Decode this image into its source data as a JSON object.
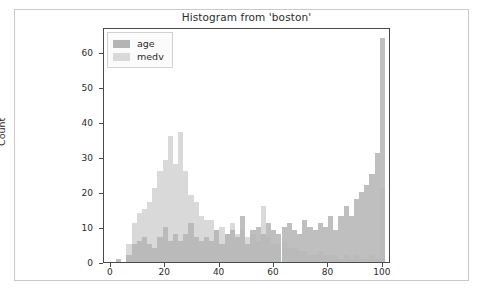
{
  "figure": {
    "title": "Histogram from 'boston'",
    "background_color": "#ffffff",
    "frame_color": "#c9c9c9"
  },
  "legend": {
    "position": "upper left",
    "entries": [
      {
        "label": "age",
        "color": "#b4b4b4"
      },
      {
        "label": "medv",
        "color": "#d9d9d9"
      }
    ]
  },
  "chart_data": {
    "type": "bar",
    "title": "Histogram from 'boston'",
    "xlabel": "",
    "ylabel": "Count",
    "xlim": [
      -2.5,
      103
    ],
    "ylim": [
      0,
      67
    ],
    "grid": false,
    "legend_position": "upper left",
    "xticks": [
      0,
      20,
      40,
      60,
      80,
      100
    ],
    "yticks": [
      0,
      10,
      20,
      30,
      40,
      50,
      60
    ],
    "bin_width": 1.9,
    "x": [
      2.9,
      4.8,
      6.7,
      8.6,
      10.5,
      12.4,
      14.3,
      16.2,
      18.1,
      20.0,
      21.9,
      23.8,
      25.7,
      27.6,
      29.5,
      31.4,
      33.3,
      35.2,
      37.1,
      39.0,
      40.9,
      42.8,
      44.7,
      46.6,
      48.5,
      50.4,
      52.3,
      54.2,
      56.1,
      58.0,
      59.9,
      61.8,
      63.7,
      65.6,
      67.5,
      69.4,
      71.3,
      73.2,
      75.1,
      77.0,
      78.9,
      80.8,
      82.7,
      84.6,
      86.5,
      88.4,
      90.3,
      92.2,
      94.1,
      96.0,
      97.9,
      99.8
    ],
    "series": [
      {
        "name": "age",
        "color": "#b4b4b4",
        "values": [
          1,
          0,
          2,
          5,
          6,
          7,
          5,
          4,
          7,
          10,
          6,
          8,
          6,
          8,
          11,
          7,
          6,
          7,
          6,
          9,
          5,
          8,
          9,
          7,
          13,
          5,
          9,
          10,
          8,
          11,
          9,
          8,
          10,
          11,
          9,
          8,
          12,
          10,
          9,
          11,
          10,
          13,
          9,
          13,
          16,
          13,
          18,
          20,
          22,
          25,
          31,
          64
        ]
      },
      {
        "name": "medv",
        "color": "#d9d9d9",
        "values": [
          0,
          0,
          5,
          11,
          14,
          15,
          17,
          21,
          26,
          29,
          36,
          28,
          37,
          26,
          19,
          17,
          13,
          12,
          12,
          9,
          10,
          8,
          11,
          8,
          9,
          7,
          8,
          6,
          16,
          7,
          5,
          5,
          6,
          4,
          4,
          3,
          3,
          2,
          2,
          3,
          2,
          2,
          2,
          1,
          2,
          1,
          2,
          1,
          1,
          2,
          1,
          21
        ]
      }
    ]
  }
}
